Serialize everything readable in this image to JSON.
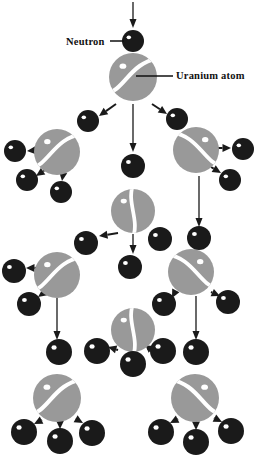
{
  "figure": {
    "background_color": "#ffffff",
    "width": 261,
    "height": 460
  },
  "colors": {
    "uranium_fill": "#999999",
    "neutron_fill": "#1a1a1a",
    "highlight": "#ffffff",
    "arrow": "#1a1a1a",
    "label_text": "#111111",
    "leader_line": "#111111"
  },
  "labels": [
    {
      "id": "neutron-label",
      "text": "Neutron",
      "x": 66,
      "y": 45,
      "anchor": "start",
      "leader": {
        "x1": 110,
        "y1": 41,
        "x2": 124,
        "y2": 41
      }
    },
    {
      "id": "uranium-label",
      "text": "Uranium atom",
      "x": 176,
      "y": 79,
      "anchor": "start",
      "leader": {
        "x1": 136,
        "y1": 76,
        "x2": 173,
        "y2": 76
      }
    }
  ],
  "uranium_atoms": [
    {
      "id": "u-gen1-center",
      "cx": 133,
      "cy": 77,
      "r": 24,
      "orientation": "s-split",
      "flip": false,
      "highlight": true
    },
    {
      "id": "u-gen2-left",
      "cx": 57,
      "cy": 152,
      "r": 23,
      "orientation": "s-split",
      "flip": false,
      "highlight": true
    },
    {
      "id": "u-gen2-right",
      "cx": 196,
      "cy": 150,
      "r": 23,
      "orientation": "s-split",
      "flip": true,
      "highlight": true
    },
    {
      "id": "u-gen3-center",
      "cx": 133,
      "cy": 211,
      "r": 22,
      "orientation": "v-split",
      "flip": false,
      "highlight": true
    },
    {
      "id": "u-gen3-left",
      "cx": 57,
      "cy": 275,
      "r": 23,
      "orientation": "s-split",
      "flip": false,
      "highlight": true
    },
    {
      "id": "u-gen3-right",
      "cx": 191,
      "cy": 272,
      "r": 23,
      "orientation": "s-split",
      "flip": true,
      "highlight": true
    },
    {
      "id": "u-gen4-center",
      "cx": 133,
      "cy": 330,
      "r": 22,
      "orientation": "v-split",
      "flip": false,
      "highlight": true
    },
    {
      "id": "u-gen4-left",
      "cx": 57,
      "cy": 398,
      "r": 24,
      "orientation": "s-split",
      "flip": false,
      "highlight": true
    },
    {
      "id": "u-gen4-right",
      "cx": 195,
      "cy": 398,
      "r": 24,
      "orientation": "s-split",
      "flip": true,
      "highlight": true
    }
  ],
  "neutrons": [
    {
      "id": "n-incident",
      "cx": 133,
      "cy": 41,
      "r": 11
    },
    {
      "id": "n-g2-left-upper",
      "cx": 88,
      "cy": 121,
      "r": 11
    },
    {
      "id": "n-g2-right-upper",
      "cx": 177,
      "cy": 119,
      "r": 11
    },
    {
      "id": "n-g2-far-left",
      "cx": 15,
      "cy": 151,
      "r": 11
    },
    {
      "id": "n-g2-far-right",
      "cx": 243,
      "cy": 149,
      "r": 11
    },
    {
      "id": "n-g2-left-lower",
      "cx": 27,
      "cy": 180,
      "r": 11
    },
    {
      "id": "n-g2-left-lower2",
      "cx": 61,
      "cy": 192,
      "r": 11
    },
    {
      "id": "n-g2-right-lower",
      "cx": 230,
      "cy": 180,
      "r": 11
    },
    {
      "id": "n-g3-center-top",
      "cx": 133,
      "cy": 166,
      "r": 12
    },
    {
      "id": "n-g3-left-diag",
      "cx": 86,
      "cy": 243,
      "r": 12
    },
    {
      "id": "n-g3-right-inner",
      "cx": 160,
      "cy": 239,
      "r": 12
    },
    {
      "id": "n-g3-far-right",
      "cx": 199,
      "cy": 238,
      "r": 12
    },
    {
      "id": "n-g4-far-left",
      "cx": 14,
      "cy": 271,
      "r": 12
    },
    {
      "id": "n-g4-left-lower",
      "cx": 29,
      "cy": 304,
      "r": 12
    },
    {
      "id": "n-g4-center",
      "cx": 130,
      "cy": 267,
      "r": 12
    },
    {
      "id": "n-g4-right-left",
      "cx": 164,
      "cy": 304,
      "r": 12
    },
    {
      "id": "n-g4-right-right",
      "cx": 228,
      "cy": 302,
      "r": 12
    },
    {
      "id": "n-g5-left",
      "cx": 59,
      "cy": 352,
      "r": 13
    },
    {
      "id": "n-g5-center-left",
      "cx": 97,
      "cy": 351,
      "r": 13
    },
    {
      "id": "n-g5-center-mid",
      "cx": 133,
      "cy": 364,
      "r": 13
    },
    {
      "id": "n-g5-center-right",
      "cx": 163,
      "cy": 351,
      "r": 13
    },
    {
      "id": "n-g5-right",
      "cx": 196,
      "cy": 352,
      "r": 13
    },
    {
      "id": "n-g6-left-a",
      "cx": 24,
      "cy": 432,
      "r": 13
    },
    {
      "id": "n-g6-left-b",
      "cx": 60,
      "cy": 441,
      "r": 13
    },
    {
      "id": "n-g6-left-c",
      "cx": 92,
      "cy": 433,
      "r": 13
    },
    {
      "id": "n-g6-right-a",
      "cx": 161,
      "cy": 432,
      "r": 13
    },
    {
      "id": "n-g6-right-b",
      "cx": 196,
      "cy": 442,
      "r": 13
    },
    {
      "id": "n-g6-right-c",
      "cx": 231,
      "cy": 431,
      "r": 13
    }
  ],
  "arrows": [
    {
      "id": "a-incident",
      "x1": 133,
      "y1": 2,
      "x2": 133,
      "y2": 28,
      "style": "long"
    },
    {
      "id": "a-g1-left",
      "x1": 116,
      "y1": 104,
      "x2": 99,
      "y2": 116,
      "style": "short"
    },
    {
      "id": "a-g1-center",
      "x1": 133,
      "y1": 104,
      "x2": 133,
      "y2": 152,
      "style": "long"
    },
    {
      "id": "a-g1-right",
      "x1": 152,
      "y1": 104,
      "x2": 167,
      "y2": 114,
      "style": "short"
    },
    {
      "id": "a-g2-left-out-left",
      "x1": 40,
      "y1": 150,
      "x2": 27,
      "y2": 151,
      "style": "short"
    },
    {
      "id": "a-g2-left-out-dl",
      "x1": 45,
      "y1": 170,
      "x2": 36,
      "y2": 176,
      "style": "short"
    },
    {
      "id": "a-g2-left-out-d",
      "x1": 63,
      "y1": 174,
      "x2": 62,
      "y2": 181,
      "style": "short"
    },
    {
      "id": "a-g2-right-out-right",
      "x1": 213,
      "y1": 148,
      "x2": 231,
      "y2": 148,
      "style": "short"
    },
    {
      "id": "a-g2-right-out-dr",
      "x1": 211,
      "y1": 167,
      "x2": 221,
      "y2": 173,
      "style": "short"
    },
    {
      "id": "a-g3-center-left",
      "x1": 118,
      "y1": 233,
      "x2": 99,
      "y2": 236,
      "style": "short"
    },
    {
      "id": "a-g3-center-down",
      "x1": 133,
      "y1": 234,
      "x2": 133,
      "y2": 254,
      "style": "long"
    },
    {
      "id": "a-g3-center-right",
      "x1": 152,
      "y1": 233,
      "x2": 169,
      "y2": 233,
      "style": "short"
    },
    {
      "id": "a-g3-right-down",
      "x1": 199,
      "y1": 176,
      "x2": 199,
      "y2": 227,
      "style": "long"
    },
    {
      "id": "a-g4-left-out-left",
      "x1": 36,
      "y1": 268,
      "x2": 26,
      "y2": 268,
      "style": "short"
    },
    {
      "id": "a-g4-left-out-dl",
      "x1": 45,
      "y1": 292,
      "x2": 38,
      "y2": 297,
      "style": "short"
    },
    {
      "id": "a-g4-left-down",
      "x1": 57,
      "y1": 298,
      "x2": 57,
      "y2": 340,
      "style": "long"
    },
    {
      "id": "a-g4-right-out-left",
      "x1": 174,
      "y1": 294,
      "x2": 172,
      "y2": 298,
      "style": "short"
    },
    {
      "id": "a-g4-right-out-right",
      "x1": 211,
      "y1": 292,
      "x2": 220,
      "y2": 296,
      "style": "short"
    },
    {
      "id": "a-g4-right-down",
      "x1": 196,
      "y1": 296,
      "x2": 196,
      "y2": 340,
      "style": "long"
    },
    {
      "id": "a-g5-center-left",
      "x1": 118,
      "y1": 350,
      "x2": 108,
      "y2": 347,
      "style": "short"
    },
    {
      "id": "a-g5-center-down",
      "x1": 133,
      "y1": 352,
      "x2": 133,
      "y2": 352,
      "style": "short"
    },
    {
      "id": "a-g5-center-right",
      "x1": 150,
      "y1": 348,
      "x2": 155,
      "y2": 346,
      "style": "short"
    },
    {
      "id": "a-g6-left-out-left",
      "x1": 42,
      "y1": 420,
      "x2": 34,
      "y2": 424,
      "style": "short"
    },
    {
      "id": "a-g6-left-out-down",
      "x1": 60,
      "y1": 422,
      "x2": 60,
      "y2": 429,
      "style": "short"
    },
    {
      "id": "a-g6-left-out-right",
      "x1": 76,
      "y1": 419,
      "x2": 83,
      "y2": 423,
      "style": "short"
    },
    {
      "id": "a-g6-right-out-left",
      "x1": 178,
      "y1": 419,
      "x2": 170,
      "y2": 423,
      "style": "short"
    },
    {
      "id": "a-g6-right-out-down",
      "x1": 196,
      "y1": 422,
      "x2": 196,
      "y2": 430,
      "style": "short"
    },
    {
      "id": "a-g6-right-out-right",
      "x1": 214,
      "y1": 418,
      "x2": 222,
      "y2": 422,
      "style": "short"
    }
  ]
}
